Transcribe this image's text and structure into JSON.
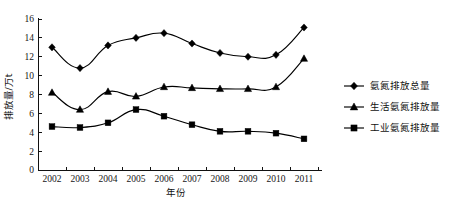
{
  "chart_data": {
    "type": "line",
    "title": "",
    "xlabel": "年份",
    "ylabel": "排放量/万t",
    "categories": [
      "2002",
      "2003",
      "2004",
      "2005",
      "2006",
      "2007",
      "2008",
      "2009",
      "2010",
      "2011"
    ],
    "ylim": [
      0,
      16
    ],
    "ytick_labels": [
      "0",
      "2",
      "4",
      "6",
      "8",
      "10",
      "12",
      "14",
      "16"
    ],
    "ytick_values": [
      0,
      2,
      4,
      6,
      8,
      10,
      12,
      14,
      16
    ],
    "grid": false,
    "legend_position": "right",
    "series": [
      {
        "name": "氨氮排放总量",
        "marker": "diamond",
        "values": [
          13.0,
          10.8,
          13.2,
          14.0,
          14.5,
          13.4,
          12.4,
          12.0,
          12.2,
          15.1
        ]
      },
      {
        "name": "生活氨氮排放量",
        "marker": "triangle",
        "values": [
          8.2,
          6.4,
          8.3,
          7.8,
          8.8,
          8.7,
          8.6,
          8.6,
          8.8,
          11.8
        ]
      },
      {
        "name": "工业氨氮排放量",
        "marker": "square",
        "values": [
          4.6,
          4.5,
          5.0,
          6.4,
          5.7,
          4.8,
          4.1,
          4.1,
          3.9,
          3.3
        ]
      }
    ],
    "colors": {
      "series": "#000000",
      "axis": "#111111",
      "background": "#ffffff"
    }
  }
}
